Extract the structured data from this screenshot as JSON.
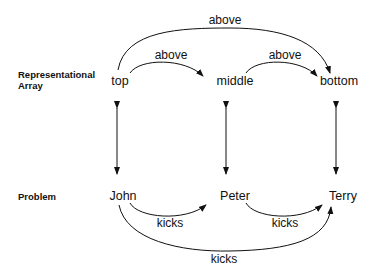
{
  "rows": {
    "representational": {
      "label_line1": "Representational",
      "label_line2": "Array"
    },
    "problem": {
      "label": "Problem"
    }
  },
  "array_nodes": [
    {
      "id": "top",
      "label": "top"
    },
    {
      "id": "middle",
      "label": "middle"
    },
    {
      "id": "bottom",
      "label": "bottom"
    }
  ],
  "problem_nodes": [
    {
      "id": "john",
      "label": "John"
    },
    {
      "id": "peter",
      "label": "Peter"
    },
    {
      "id": "terry",
      "label": "Terry"
    }
  ],
  "array_edges": [
    {
      "from": "top",
      "to": "middle",
      "label": "above"
    },
    {
      "from": "middle",
      "to": "bottom",
      "label": "above"
    },
    {
      "from": "top",
      "to": "bottom",
      "label": "above"
    }
  ],
  "problem_edges": [
    {
      "from": "john",
      "to": "peter",
      "label": "kicks"
    },
    {
      "from": "peter",
      "to": "terry",
      "label": "kicks"
    },
    {
      "from": "john",
      "to": "terry",
      "label": "kicks"
    }
  ],
  "mappings": [
    {
      "from": "top",
      "to": "john",
      "type": "bidirectional"
    },
    {
      "from": "middle",
      "to": "peter",
      "type": "bidirectional"
    },
    {
      "from": "bottom",
      "to": "terry",
      "type": "bidirectional"
    }
  ]
}
